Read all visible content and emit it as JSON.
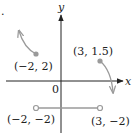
{
  "figure": {
    "marker": ".",
    "axes": {
      "x_label": "x",
      "y_label": "y",
      "origin_label": "0"
    },
    "points": [
      {
        "label": "(−2, 2)",
        "x": -2,
        "y": 2,
        "style": "closed"
      },
      {
        "label": "(3, 1.5)",
        "x": 3,
        "y": 1.5,
        "style": "closed"
      },
      {
        "label": "(−2, −2)",
        "x": -2,
        "y": -2,
        "style": "open"
      },
      {
        "label": "(3, −2)",
        "x": 3,
        "y": -2,
        "style": "open"
      }
    ],
    "pieces": [
      {
        "name": "left-curve",
        "from": "(-2, 2)",
        "direction": "up-left, unbounded"
      },
      {
        "name": "right-curve",
        "from": "(3, 1.5)",
        "direction": "down-right, unbounded"
      },
      {
        "name": "middle-segment",
        "from": "(-2, -2)",
        "to": "(3, -2)",
        "endpoints": "open"
      }
    ],
    "colors": {
      "axis": "#222222",
      "curve": "#9a9a9a",
      "point": "#9a9a9a",
      "text": "#222222"
    }
  }
}
